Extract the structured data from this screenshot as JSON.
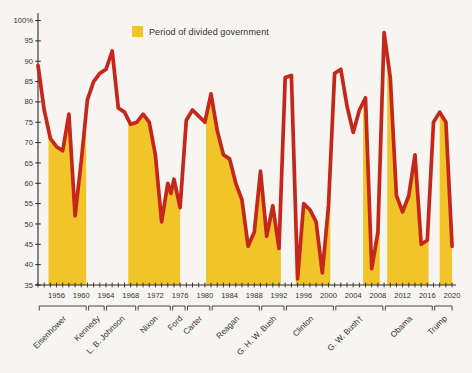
{
  "legend": {
    "label": "Period of divided government"
  },
  "colors": {
    "background": "#f6f5f1",
    "line": "#c5271b",
    "band": "#f1c42a",
    "axis": "#2e2a26",
    "text": "#37332f"
  },
  "chart_data": {
    "type": "line",
    "title": "",
    "xlabel": "",
    "ylabel": "",
    "x_range": [
      1953,
      2020.3
    ],
    "ylim": [
      35,
      100
    ],
    "grid": false,
    "legend_position": "top-left-inside",
    "y_ticks": [
      35,
      40,
      45,
      50,
      55,
      60,
      65,
      70,
      75,
      80,
      85,
      90,
      95,
      100
    ],
    "y_tick_labels": [
      "35",
      "40",
      "45",
      "50",
      "55",
      "60",
      "65",
      "70",
      "75",
      "80",
      "85",
      "90",
      "95",
      "100%"
    ],
    "x_tick_years": [
      1956,
      1960,
      1964,
      1968,
      1972,
      1976,
      1980,
      1984,
      1988,
      1992,
      1996,
      2000,
      2004,
      2008,
      2012,
      2016,
      2020
    ],
    "points": [
      [
        1953,
        89
      ],
      [
        1954,
        78
      ],
      [
        1955,
        71
      ],
      [
        1956,
        69
      ],
      [
        1957,
        68
      ],
      [
        1958,
        77
      ],
      [
        1959,
        52
      ],
      [
        1960,
        65.5
      ],
      [
        1961,
        80.5
      ],
      [
        1962,
        85
      ],
      [
        1963,
        87
      ],
      [
        1964,
        88
      ],
      [
        1965,
        92.5
      ],
      [
        1966,
        78.5
      ],
      [
        1967,
        77.5
      ],
      [
        1968,
        74.5
      ],
      [
        1969,
        75
      ],
      [
        1970,
        77
      ],
      [
        1971,
        75
      ],
      [
        1972,
        67
      ],
      [
        1973,
        50.5
      ],
      [
        1974,
        60
      ],
      [
        1974.5,
        57.5
      ],
      [
        1975,
        61
      ],
      [
        1976,
        54
      ],
      [
        1977,
        75.5
      ],
      [
        1978,
        78
      ],
      [
        1979,
        76.5
      ],
      [
        1980,
        75
      ],
      [
        1981,
        82
      ],
      [
        1982,
        73
      ],
      [
        1983,
        67
      ],
      [
        1984,
        66
      ],
      [
        1985,
        60
      ],
      [
        1986,
        56
      ],
      [
        1987,
        44.5
      ],
      [
        1988,
        48
      ],
      [
        1989,
        63
      ],
      [
        1990,
        47
      ],
      [
        1991,
        54.5
      ],
      [
        1992,
        44
      ],
      [
        1993,
        86
      ],
      [
        1994,
        86.5
      ],
      [
        1995,
        36.5
      ],
      [
        1996,
        55
      ],
      [
        1997,
        53.5
      ],
      [
        1998,
        50.5
      ],
      [
        1999,
        38
      ],
      [
        2000,
        54.5
      ],
      [
        2001,
        87
      ],
      [
        2002,
        88
      ],
      [
        2003,
        79
      ],
      [
        2004,
        72.5
      ],
      [
        2005,
        78
      ],
      [
        2006,
        81
      ],
      [
        2007,
        39
      ],
      [
        2008,
        48
      ],
      [
        2009,
        97
      ],
      [
        2010,
        86
      ],
      [
        2011,
        57
      ],
      [
        2012,
        53
      ],
      [
        2013,
        57
      ],
      [
        2014,
        67
      ],
      [
        2015,
        45
      ],
      [
        2016,
        46
      ],
      [
        2017,
        75
      ],
      [
        2018,
        77.5
      ],
      [
        2019,
        75
      ],
      [
        2020,
        44.5
      ]
    ],
    "divided_government_bands": [
      [
        1954.7,
        1960.8
      ],
      [
        1967.6,
        1976.0
      ],
      [
        1980.2,
        1992.3
      ],
      [
        1994.7,
        2000.3
      ],
      [
        2005.6,
        2008.3
      ],
      [
        2009.5,
        2016.2
      ],
      [
        2018.0,
        2020.3
      ]
    ],
    "presidents": [
      {
        "name": "Eisenhower",
        "from": 1953,
        "to": 1961
      },
      {
        "name": "Kennedy",
        "from": 1961,
        "to": 1963.9
      },
      {
        "name": "L. B. Johnson",
        "from": 1963.9,
        "to": 1969
      },
      {
        "name": "Nixon",
        "from": 1969,
        "to": 1974.6
      },
      {
        "name": "Ford",
        "from": 1974.6,
        "to": 1977
      },
      {
        "name": "Carter",
        "from": 1977,
        "to": 1981
      },
      {
        "name": "Reagan",
        "from": 1981,
        "to": 1989
      },
      {
        "name": "G. H. W. Bush",
        "from": 1989,
        "to": 1993
      },
      {
        "name": "Clinton",
        "from": 1993,
        "to": 2001
      },
      {
        "name": "G. W. Bush†",
        "from": 2001,
        "to": 2009
      },
      {
        "name": "Obama",
        "from": 2009,
        "to": 2017
      },
      {
        "name": "Trump",
        "from": 2017,
        "to": 2020.2
      }
    ]
  }
}
